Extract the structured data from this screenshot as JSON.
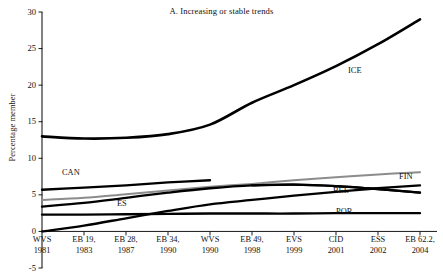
{
  "chart_data": {
    "type": "line",
    "title": "A. Increasing or stable trends",
    "xlabel": "",
    "ylabel": "Percentage member",
    "ylim": [
      -5,
      30
    ],
    "yticks": [
      -5,
      0,
      5,
      10,
      15,
      20,
      25,
      30
    ],
    "ytick_labels": [
      "-5",
      "0",
      "5",
      "10",
      "15",
      "20",
      "25",
      "30"
    ],
    "grid": false,
    "legend": "inline-series-labels",
    "x_categories": [
      {
        "line1": "WVS",
        "line2": "1981"
      },
      {
        "line1": "EB 19,",
        "line2": "1983"
      },
      {
        "line1": "EB 28,",
        "line2": "1987"
      },
      {
        "line1": "EB 34,",
        "line2": "1990"
      },
      {
        "line1": "WVS",
        "line2": "1990"
      },
      {
        "line1": "EB 49,",
        "line2": "1998"
      },
      {
        "line1": "EVS",
        "line2": "1999"
      },
      {
        "line1": "CID",
        "line2": "2001"
      },
      {
        "line1": "ESS",
        "line2": "2002"
      },
      {
        "line1": "EB 62.2,",
        "line2": "2004"
      }
    ],
    "x_index": [
      0,
      1,
      2,
      3,
      4,
      5,
      6,
      7,
      8,
      9
    ],
    "series": [
      {
        "name": "ICE",
        "color": "#000000",
        "width": 2.6,
        "x": [
          0,
          1,
          2,
          3,
          4,
          5,
          6,
          7,
          8,
          9
        ],
        "values": [
          13.0,
          12.7,
          12.8,
          13.3,
          14.6,
          17.6,
          20.0,
          22.6,
          25.6,
          29.0
        ]
      },
      {
        "name": "CAN",
        "color": "#000000",
        "width": 2.3,
        "x": [
          0,
          1,
          2,
          3,
          4
        ],
        "values": [
          5.7,
          6.0,
          6.3,
          6.7,
          7.0
        ]
      },
      {
        "name": "FIN",
        "color": "#8c8c8c",
        "width": 2.0,
        "x": [
          0,
          1,
          2,
          3,
          4,
          5,
          6,
          7,
          8,
          9
        ],
        "values": [
          4.3,
          4.6,
          5.1,
          5.6,
          6.1,
          6.5,
          7.0,
          7.4,
          7.8,
          8.1
        ]
      },
      {
        "name": "ES",
        "color": "#000000",
        "width": 2.3,
        "x": [
          0,
          1,
          2,
          3,
          4,
          5,
          6,
          7,
          8,
          9
        ],
        "values": [
          3.4,
          3.9,
          4.6,
          5.3,
          5.9,
          6.3,
          6.4,
          6.2,
          5.8,
          5.3
        ]
      },
      {
        "name": "BEL",
        "color": "#000000",
        "width": 2.3,
        "x": [
          5,
          6,
          7,
          8,
          9
        ],
        "values": [
          6.3,
          6.4,
          6.2,
          5.8,
          5.3
        ]
      },
      {
        "name": "POR",
        "color": "#000000",
        "width": 2.3,
        "x": [
          0,
          1,
          2,
          3,
          4,
          5,
          6,
          7,
          8,
          9
        ],
        "values": [
          2.3,
          2.3,
          2.35,
          2.4,
          2.45,
          2.45,
          2.45,
          2.5,
          2.5,
          2.5
        ]
      },
      {
        "name": "lower-rising",
        "color": "#000000",
        "width": 2.3,
        "x": [
          0,
          1,
          2,
          3,
          4,
          5,
          6,
          7,
          8,
          9
        ],
        "values": [
          0.0,
          0.8,
          1.8,
          2.8,
          3.7,
          4.3,
          4.9,
          5.4,
          5.9,
          6.3
        ]
      }
    ],
    "series_labels": [
      {
        "name": "ICE",
        "x": 348,
        "y": 66
      },
      {
        "name": "CAN",
        "x": 62,
        "y": 168
      },
      {
        "name": "FIN",
        "x": 399,
        "y": 172
      },
      {
        "name": "ES",
        "x": 117,
        "y": 199
      },
      {
        "name": "BEL",
        "x": 333,
        "y": 186
      },
      {
        "name": "POR",
        "x": 336,
        "y": 207
      }
    ]
  }
}
